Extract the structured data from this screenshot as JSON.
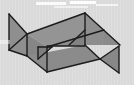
{
  "canvas": {
    "width": 134,
    "height": 85,
    "background_color": "#d9d9d9",
    "texture": "vertical-stripes",
    "alt_text": "Gray shaded 3D polyhedron wireframe thumbnail"
  },
  "figure": {
    "name": "3d-polyhedron",
    "fill_color": "#8c8c8c",
    "fill_color_light": "#9a9a9a",
    "fill_color_dark": "#7d7d7d",
    "stroke_color": "#1c1c1c",
    "stroke_width": 1.4,
    "faces": [
      {
        "name": "left-fin",
        "fill": "#8a8a8a",
        "points": "9,14 27,34 9,50"
      },
      {
        "name": "left-side-panel",
        "fill": "#8f8f8f",
        "points": "9,14 27,34 27,56 9,50"
      },
      {
        "name": "top-face",
        "fill": "#949494",
        "points": "27,34 85,13 104,30 47,47"
      },
      {
        "name": "front-face",
        "fill": "#868686",
        "points": "27,34 47,47 47,72 27,56"
      },
      {
        "name": "bottom-left-face",
        "fill": "#8b8b8b",
        "points": "27,56 47,72 100,59 85,45"
      },
      {
        "name": "right-upper-face",
        "fill": "#8f8f8f",
        "points": "85,13 104,30 104,45 85,45"
      },
      {
        "name": "right-fin-upper",
        "fill": "#8a8a8a",
        "points": "104,30 120,45 104,45"
      },
      {
        "name": "right-fin-lower",
        "fill": "#888888",
        "points": "100,59 119,46 119,73"
      },
      {
        "name": "inner-small-triangle",
        "fill": "#7f7f7f",
        "points": "38,47 52,47 38,59"
      },
      {
        "name": "inner-wedge-right",
        "fill": "#828282",
        "points": "69,45 85,45 85,30"
      }
    ],
    "edges": [
      {
        "name": "edge-left-fin-top",
        "x1": 9,
        "y1": 14,
        "x2": 27,
        "y2": 34
      },
      {
        "name": "edge-left-fin-bottom",
        "x1": 9,
        "y1": 50,
        "x2": 27,
        "y2": 34
      },
      {
        "name": "edge-left-vertical",
        "x1": 9,
        "y1": 14,
        "x2": 9,
        "y2": 50
      },
      {
        "name": "edge-top-left-to-apex",
        "x1": 27,
        "y1": 34,
        "x2": 85,
        "y2": 13
      },
      {
        "name": "edge-apex-to-right",
        "x1": 85,
        "y1": 13,
        "x2": 120,
        "y2": 45
      },
      {
        "name": "edge-apex-vertical",
        "x1": 85,
        "y1": 13,
        "x2": 85,
        "y2": 45
      },
      {
        "name": "edge-inner-top",
        "x1": 47,
        "y1": 47,
        "x2": 104,
        "y2": 30
      },
      {
        "name": "edge-inner-diag",
        "x1": 69,
        "y1": 45,
        "x2": 85,
        "y2": 30
      },
      {
        "name": "edge-inner-horizontal",
        "x1": 47,
        "y1": 46,
        "x2": 85,
        "y2": 46
      },
      {
        "name": "edge-front-left-vertical",
        "x1": 27,
        "y1": 34,
        "x2": 27,
        "y2": 56
      },
      {
        "name": "edge-front-mid-vertical",
        "x1": 47,
        "y1": 47,
        "x2": 47,
        "y2": 72
      },
      {
        "name": "edge-bottom-left",
        "x1": 9,
        "y1": 50,
        "x2": 27,
        "y2": 56
      },
      {
        "name": "edge-bottom-left-lower",
        "x1": 27,
        "y1": 56,
        "x2": 47,
        "y2": 72
      },
      {
        "name": "edge-bottom-run",
        "x1": 47,
        "y1": 72,
        "x2": 100,
        "y2": 59
      },
      {
        "name": "edge-bottom-to-fin",
        "x1": 100,
        "y1": 59,
        "x2": 119,
        "y2": 73
      },
      {
        "name": "edge-right-fin-vertical",
        "x1": 119,
        "y1": 46,
        "x2": 119,
        "y2": 73
      },
      {
        "name": "edge-right-fin-diag",
        "x1": 100,
        "y1": 59,
        "x2": 119,
        "y2": 46
      },
      {
        "name": "edge-mid-right-slant",
        "x1": 85,
        "y1": 45,
        "x2": 100,
        "y2": 59
      },
      {
        "name": "edge-small-tri-top",
        "x1": 38,
        "y1": 47,
        "x2": 52,
        "y2": 47
      },
      {
        "name": "edge-small-tri-diag",
        "x1": 52,
        "y1": 47,
        "x2": 38,
        "y2": 59
      },
      {
        "name": "edge-small-tri-left",
        "x1": 38,
        "y1": 47,
        "x2": 38,
        "y2": 59
      }
    ]
  },
  "highlights": [
    {
      "name": "glare-streak-left",
      "x": 36,
      "y": 2,
      "width": 30,
      "height": 3,
      "color": "#ffffff",
      "opacity": 0.85
    },
    {
      "name": "glare-streak-center",
      "x": 70,
      "y": 1,
      "width": 26,
      "height": 3,
      "color": "#ffffff",
      "opacity": 0.9
    },
    {
      "name": "glare-streak-right",
      "x": 96,
      "y": 4,
      "width": 22,
      "height": 2,
      "color": "#ffffff",
      "opacity": 0.7
    },
    {
      "name": "glare-streak-upper",
      "x": 54,
      "y": 6,
      "width": 34,
      "height": 2,
      "color": "#ffffff",
      "opacity": 0.55
    },
    {
      "name": "glare-patch-mid-left",
      "x": 0,
      "y": 40,
      "width": 10,
      "height": 4,
      "color": "#ffffff",
      "opacity": 0.45
    }
  ]
}
